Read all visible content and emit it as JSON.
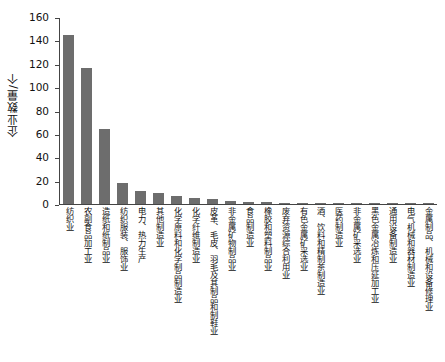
{
  "chart_data": {
    "type": "bar",
    "title": "",
    "xlabel": "",
    "ylabel": "企业数量/个",
    "ylim": [
      0,
      160
    ],
    "yticks": [
      0,
      20,
      40,
      60,
      80,
      100,
      120,
      140,
      160
    ],
    "grid": false,
    "legend": false,
    "bar_color": "#6d6d6d",
    "categories": [
      "纺织业",
      "农副食品加工业",
      "造纸和纸制品业",
      "纺织服装、服饰业",
      "电力、热力生产",
      "其他制造业",
      "化学原料和化学制品制造业",
      "化学纤维制造业",
      "皮革、毛皮、羽毛及其制品和制鞋业",
      "非金属矿物制品业",
      "食品制造业",
      "橡胶和塑料制品业",
      "废弃资源综合利用业",
      "有色金属矿采选业",
      "酒、饮料和精制茶制造业",
      "医药制造业",
      "非金属矿采选业",
      "黑色金属冶炼和压延加工业",
      "通用设备制造业",
      "电气机械和器材制造业",
      "金属制品、机械和设备修理业"
    ],
    "values": [
      145,
      116,
      64,
      18,
      11,
      9,
      7,
      5,
      4,
      3,
      2,
      2,
      1,
      1,
      1,
      1,
      1,
      1,
      1,
      1,
      1
    ]
  }
}
